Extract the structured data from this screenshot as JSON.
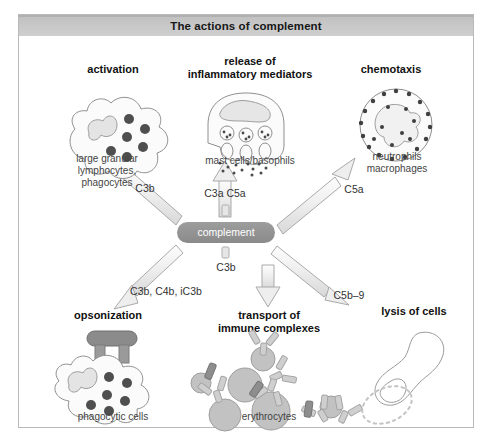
{
  "figure": {
    "title": "The actions of complement",
    "center_node": "complement"
  },
  "branches": [
    {
      "id": "activation",
      "heading": "activation",
      "mediator": "C3b",
      "caption": "large granular\nlymphocytes,\nphagocytes"
    },
    {
      "id": "inflammation",
      "heading": "release of\ninflammatory mediators",
      "mediator": "C3a C5a",
      "caption": "mast cells/basophils"
    },
    {
      "id": "chemotaxis",
      "heading": "chemotaxis",
      "mediator": "C5a",
      "caption": "neutrophils\nmacrophages"
    },
    {
      "id": "opsonization",
      "heading": "opsonization",
      "mediator": "C3b, C4b, iC3b",
      "caption": "phagocytic cells"
    },
    {
      "id": "transport",
      "heading": "transport of\nimmune complexes",
      "mediator": "C3b",
      "caption": "erythrocytes"
    },
    {
      "id": "lysis",
      "heading": "lysis of cells",
      "mediator": "C5b–9",
      "caption": ""
    }
  ],
  "headings": {
    "activation": "activation",
    "inflammation_l1": "release of",
    "inflammation_l2": "inflammatory mediators",
    "chemotaxis": "chemotaxis",
    "opsonization": "opsonization",
    "transport_l1": "transport of",
    "transport_l2": "immune complexes",
    "lysis": "lysis of cells"
  },
  "captions": {
    "activation_l1": "large granular",
    "activation_l2": "lymphocytes,",
    "activation_l3": "phagocytes",
    "inflammation": "mast cells/basophils",
    "chemotaxis_l1": "neutrophils",
    "chemotaxis_l2": "macrophages",
    "opsonization": "phagocytic cells",
    "transport": "erythrocytes"
  },
  "mediators": {
    "c3b_activation": "C3b",
    "c3a_c5a": "C3a C5a",
    "c5a": "C5a",
    "c3b_c4b_ic3b": "C3b, C4b, iC3b",
    "c3b_transport": "C3b",
    "c5b9": "C5b–9"
  },
  "colors": {
    "title_bar": "#c8c8c8",
    "title_text": "#171717",
    "pill_fill": "#949494",
    "pill_text": "#ffffff",
    "arrow_fill": "#ececec",
    "arrow_stroke": "#a8a8a8",
    "cell_fill": "#fbfbfb",
    "cell_stroke": "#9a9a9a",
    "granule": "#5a5a5a",
    "erythrocyte": "#bdbdbd",
    "antibody": "#c9c9c9",
    "antigen": "#8e8e8e",
    "frame_border": "#b9b9b9",
    "background": "#ffffff"
  }
}
